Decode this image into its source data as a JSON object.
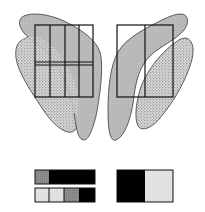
{
  "figure": {
    "colors": {
      "background": "#ffffff",
      "grey_fill": "#bdbdbd",
      "stipple_fill": "#d4d4d4",
      "stipple_dot": "#6a6a6a",
      "outline": "#1a1a1a",
      "black": "#000000",
      "light_cell": "#e2e2e2",
      "mid_grey_cell": "#8a8a8a"
    },
    "left_panel": {
      "grid_columns": 4,
      "grid_rows": 2
    },
    "right_panel": {
      "grid_columns": 2,
      "grid_rows": 1
    },
    "bottom_left_bars": {
      "top_bar": [
        "mid-grey",
        "black"
      ],
      "bottom_bar": [
        "light",
        "light",
        "mid-grey",
        "black"
      ]
    },
    "bottom_right_block": [
      "black",
      "light"
    ]
  }
}
